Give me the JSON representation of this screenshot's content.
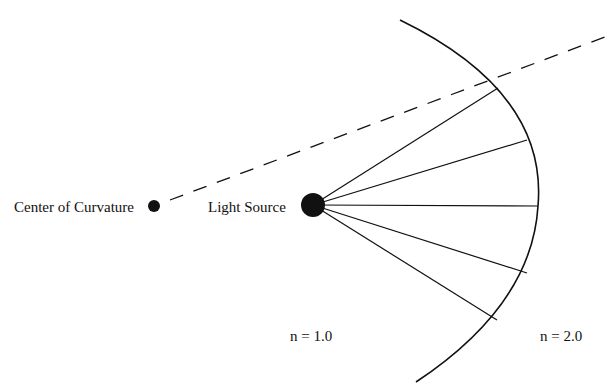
{
  "diagram": {
    "labels": {
      "center_of_curvature": "Center of Curvature",
      "light_source": "Light Source",
      "n_inner": "n = 1.0",
      "n_outer": "n = 2.0"
    },
    "colors": {
      "ink": "#111111",
      "background": "#ffffff"
    },
    "points": {
      "center_of_curvature": {
        "x": 154,
        "y": 206,
        "r": 6
      },
      "light_source": {
        "x": 313,
        "y": 205,
        "r": 12
      }
    },
    "interface_arc": {
      "start": {
        "x": 400,
        "y": 20
      },
      "apex": {
        "x": 538,
        "y": 206
      },
      "end": {
        "x": 416,
        "y": 382
      }
    },
    "rays": [
      {
        "x2": 498,
        "y2": 88
      },
      {
        "x2": 527,
        "y2": 140
      },
      {
        "x2": 538,
        "y2": 206
      },
      {
        "x2": 527,
        "y2": 273
      },
      {
        "x2": 497,
        "y2": 320
      }
    ],
    "dashed_line": {
      "x1": 170,
      "y1": 200,
      "x2": 605,
      "y2": 37
    }
  }
}
